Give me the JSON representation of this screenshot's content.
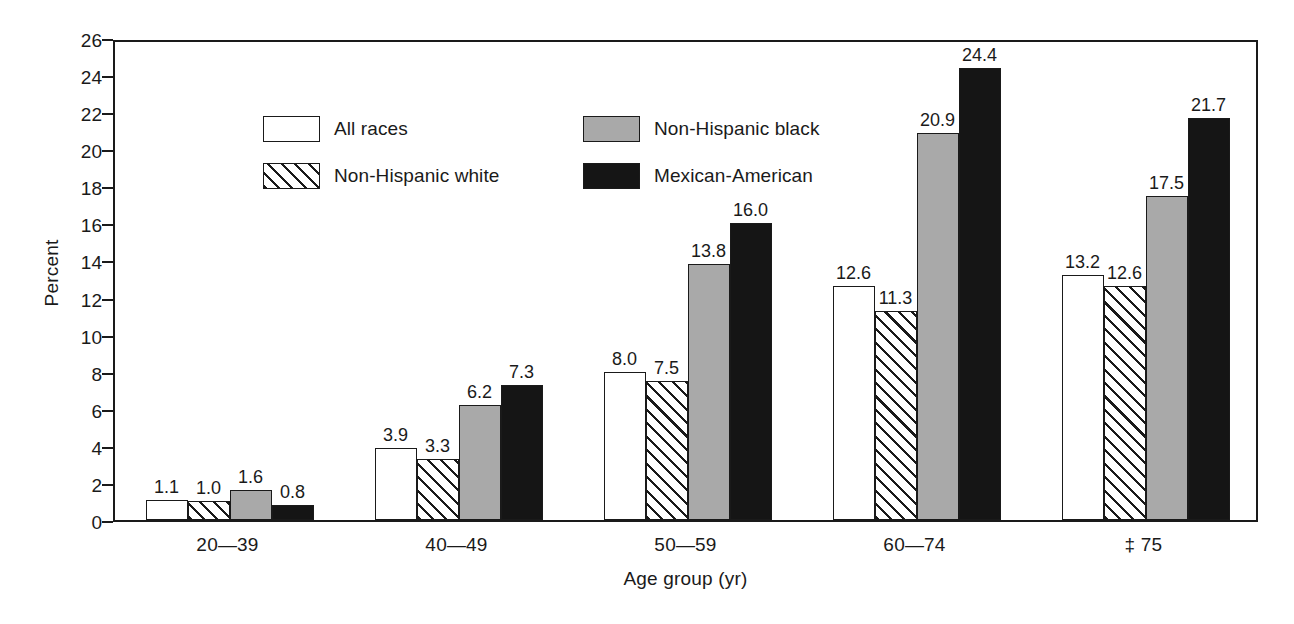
{
  "chart_data": {
    "type": "bar",
    "title": "",
    "xlabel": "Age group (yr)",
    "ylabel": "Percent",
    "ylim": [
      0,
      26
    ],
    "ytick_step": 2,
    "yticks": [
      "0",
      "2",
      "4",
      "6",
      "8",
      "10",
      "12",
      "14",
      "16",
      "18",
      "20",
      "22",
      "24",
      "26"
    ],
    "grid": false,
    "legend_position": "top-left-inside",
    "categories": [
      "20—39",
      "40—49",
      "50—59",
      "60—74",
      "‡ 75"
    ],
    "series": [
      {
        "name": "All races",
        "fill": "white",
        "color": "#ffffff",
        "values": [
          1.1,
          3.9,
          8.0,
          12.6,
          13.2
        ],
        "labels": [
          "1.1",
          "3.9",
          "8.0",
          "12.6",
          "13.2"
        ]
      },
      {
        "name": "Non-Hispanic white",
        "fill": "hatched",
        "color": "#ffffff",
        "values": [
          1.0,
          3.3,
          7.5,
          11.3,
          12.6
        ],
        "labels": [
          "1.0",
          "3.3",
          "7.5",
          "11.3",
          "12.6"
        ]
      },
      {
        "name": "Non-Hispanic black",
        "fill": "gray",
        "color": "#a9a9a9",
        "values": [
          1.6,
          6.2,
          13.8,
          20.9,
          17.5
        ],
        "labels": [
          "1.6",
          "6.2",
          "13.8",
          "20.9",
          "17.5"
        ]
      },
      {
        "name": "Mexican-American",
        "fill": "black",
        "color": "#151515",
        "values": [
          0.8,
          7.3,
          16.0,
          24.4,
          21.7
        ],
        "labels": [
          "0.8",
          "7.3",
          "16.0",
          "24.4",
          "21.7"
        ]
      }
    ]
  }
}
